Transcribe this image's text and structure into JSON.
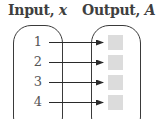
{
  "diagram": {
    "type": "mapping-diagram",
    "input_header": {
      "label": "Input, ",
      "variable": "x"
    },
    "output_header": {
      "label": "Output, ",
      "variable": "A"
    },
    "inputs": [
      "1",
      "2",
      "3",
      "4"
    ],
    "outputs": [
      "",
      "",
      "",
      ""
    ],
    "arrows": [
      {
        "from": "1",
        "to": 0
      },
      {
        "from": "2",
        "to": 1
      },
      {
        "from": "3",
        "to": 2
      },
      {
        "from": "4",
        "to": 3
      }
    ],
    "colors": {
      "outline": "#3a3a3a",
      "output_box": "#dcdcdc",
      "header_text": "#3f3f3f",
      "number_text": "#555555"
    }
  }
}
